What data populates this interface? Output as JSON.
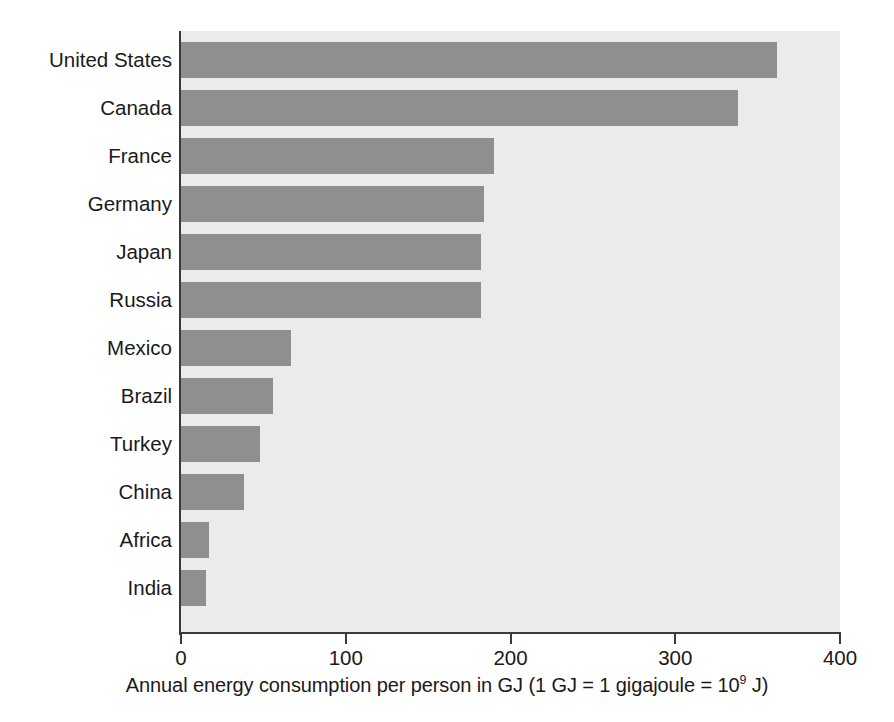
{
  "chart_data": {
    "type": "bar",
    "orientation": "horizontal",
    "title": "",
    "xlabel": "Annual energy consumption per person in GJ (1 GJ = 1 gigajoule = 10⁹ J)",
    "ylabel": "",
    "xlim": [
      0,
      400
    ],
    "xticks": [
      0,
      100,
      200,
      300,
      400
    ],
    "xtick_labels": [
      "0",
      "100",
      "200",
      "300",
      "400"
    ],
    "grid": false,
    "legend": false,
    "bar_color": "#8f8f8f",
    "plot_background": "#ebebeb",
    "axis_color": "#3a3a3a",
    "categories": [
      "United States",
      "Canada",
      "France",
      "Germany",
      "Japan",
      "Russia",
      "Mexico",
      "Brazil",
      "Turkey",
      "China",
      "Africa",
      "India"
    ],
    "values": [
      362,
      338,
      190,
      184,
      182,
      182,
      67,
      56,
      48,
      38,
      17,
      15
    ],
    "units": "GJ per person per year"
  },
  "caption": {
    "prefix": "Annual energy consumption per person in GJ (1 GJ = 1 gigajoule = 10",
    "exponent": "9",
    "suffix": " J)"
  }
}
